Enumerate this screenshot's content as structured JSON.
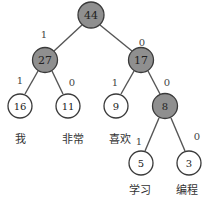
{
  "diagram": {
    "type": "huffman-tree",
    "colors": {
      "internal_fill": "#8f8f8f",
      "leaf_fill": "#ffffff",
      "stroke": "#3a3a3a",
      "edge": "#555555"
    },
    "nodes": {
      "n44": {
        "value": "44",
        "kind": "internal"
      },
      "n27": {
        "value": "27",
        "kind": "internal"
      },
      "n17": {
        "value": "17",
        "kind": "internal"
      },
      "n16": {
        "value": "16",
        "kind": "leaf",
        "word": "我"
      },
      "n11": {
        "value": "11",
        "kind": "leaf",
        "word": "非常"
      },
      "n9": {
        "value": "9",
        "kind": "leaf",
        "word": "喜欢"
      },
      "n8": {
        "value": "8",
        "kind": "internal"
      },
      "n5": {
        "value": "5",
        "kind": "leaf",
        "word": "学习"
      },
      "n3": {
        "value": "3",
        "kind": "leaf",
        "word": "编程"
      }
    },
    "edges": {
      "e44_27": {
        "from": "44",
        "to": "27",
        "label": "1"
      },
      "e44_17": {
        "from": "44",
        "to": "17",
        "label": "0"
      },
      "e27_16": {
        "from": "27",
        "to": "16",
        "label": "1"
      },
      "e27_11": {
        "from": "27",
        "to": "11",
        "label": "0"
      },
      "e17_9": {
        "from": "17",
        "to": "9",
        "label": "1"
      },
      "e17_8": {
        "from": "17",
        "to": "8",
        "label": "0"
      },
      "e8_5": {
        "from": "8",
        "to": "5",
        "label": "1"
      },
      "e8_3": {
        "from": "8",
        "to": "3",
        "label": "0"
      }
    }
  }
}
